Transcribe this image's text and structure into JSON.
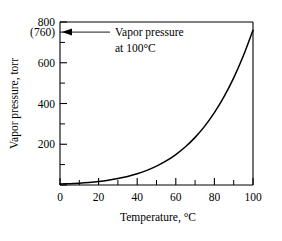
{
  "chart_data": {
    "type": "line",
    "title": "",
    "xlabel": "Temperature, °C",
    "ylabel": "Vapor pressure, torr",
    "xlim": [
      0,
      100
    ],
    "ylim": [
      0,
      800
    ],
    "grid": false,
    "legend": null,
    "x_ticks_major": [
      0,
      20,
      40,
      60,
      80,
      100
    ],
    "x_tick_labels": [
      "0",
      "20",
      "40",
      "60",
      "80",
      "100"
    ],
    "x_ticks_minor": [
      10,
      30,
      50,
      70,
      90
    ],
    "y_ticks_major": [
      200,
      400,
      600,
      800
    ],
    "y_tick_labels": [
      "200",
      "400",
      "600",
      "800"
    ],
    "y_ticks_minor": [
      100,
      300,
      500,
      700
    ],
    "special_y_tick": {
      "value": 760,
      "label": "(760)"
    },
    "series": [
      {
        "name": "Vapor pressure of water",
        "x": [
          0,
          5,
          10,
          15,
          20,
          25,
          30,
          35,
          40,
          45,
          50,
          55,
          60,
          65,
          70,
          75,
          80,
          85,
          90,
          95,
          100
        ],
        "y": [
          4.6,
          6.5,
          9.2,
          12.8,
          17.5,
          23.8,
          31.8,
          42.2,
          55.3,
          71.9,
          92.5,
          118.0,
          149.4,
          187.5,
          233.7,
          289.1,
          355.1,
          433.6,
          525.8,
          633.9,
          760.0
        ]
      }
    ],
    "annotations": [
      {
        "name": "vapor-pressure-annotation",
        "line1": "Vapor pressure",
        "line2": "at 100°C",
        "points_to_value": 760,
        "arrow_direction": "left"
      }
    ]
  },
  "axes": {
    "x_axis_label": "Temperature, °C",
    "y_axis_label": "Vapor pressure, torr"
  },
  "colors": {
    "curve": "#000000",
    "frame": "#000000",
    "text": "#000000",
    "background": "#ffffff"
  }
}
